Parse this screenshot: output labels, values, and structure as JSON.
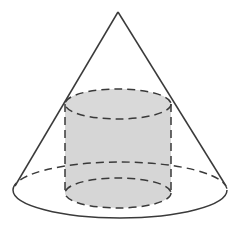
{
  "figure": {
    "colors": {
      "background": "#ffffff",
      "line": "#3a3a3a",
      "cylinder_fill": "#d6d6d6"
    },
    "cone": {
      "apex": [
        118,
        12
      ],
      "base_center": [
        120,
        190
      ],
      "base_rx": 107,
      "base_ry": 28,
      "left_tangent": [
        15,
        186
      ],
      "right_tangent": [
        226,
        186
      ]
    },
    "cylinder": {
      "center_x": 118,
      "top_y": 104,
      "bottom_y": 193,
      "rx": 53,
      "ry": 15
    }
  }
}
